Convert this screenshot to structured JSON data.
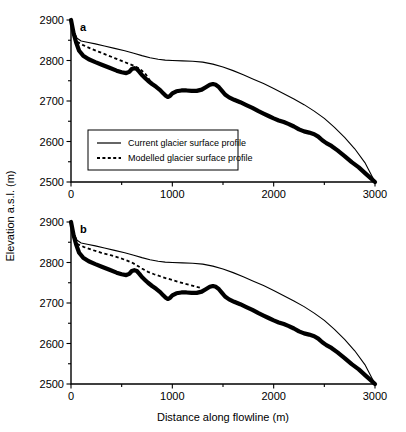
{
  "figure": {
    "xlabel": "Distance along flowline (m)",
    "ylabel": "Elevation a.s.l. (m)",
    "legend": {
      "current_label": "Current glacier surface profile",
      "modelled_label": "Modelled glacier surface profile"
    },
    "panel_a_label": "a",
    "panel_b_label": "b"
  },
  "chart_data": {
    "type": "line",
    "title": "",
    "xlabel": "Distance along flowline (m)",
    "ylabel": "Elevation a.s.l. (m)",
    "xlim": [
      0,
      3000
    ],
    "ylim": [
      2500,
      2900
    ],
    "xticks": [
      0,
      500,
      1000,
      1500,
      2000,
      2500,
      3000
    ],
    "xticklabels": [
      "0",
      "",
      "1000",
      "",
      "2000",
      "",
      "3000"
    ],
    "yticks": [
      2500,
      2550,
      2600,
      2650,
      2700,
      2750,
      2800,
      2850,
      2900
    ],
    "yticklabels": [
      "2500",
      "",
      "2600",
      "",
      "2700",
      "",
      "2800",
      "",
      "2900"
    ],
    "grid": false,
    "legend_position": "lower left",
    "panels": [
      {
        "label": "a",
        "series": [
          {
            "name": "Current glacier surface profile",
            "style": "solid-thin",
            "x": [
              0,
              30,
              60,
              100,
              160,
              240,
              330,
              430,
              530,
              620,
              700,
              780,
              860,
              930,
              1000,
              1100,
              1200,
              1300,
              1400,
              1500,
              1600,
              1700,
              1800,
              1900,
              2000,
              2100,
              2200,
              2300,
              2400,
              2500,
              2600,
              2700,
              2800,
              2900,
              3000
            ],
            "y": [
              2900,
              2872,
              2855,
              2848,
              2845,
              2841,
              2836,
              2830,
              2824,
              2818,
              2812,
              2807,
              2803,
              2801,
              2800,
              2799,
              2798,
              2796,
              2791,
              2784,
              2775,
              2765,
              2754,
              2743,
              2731,
              2718,
              2705,
              2691,
              2675,
              2657,
              2635,
              2610,
              2582,
              2548,
              2500
            ]
          },
          {
            "name": "Modelled glacier surface profile",
            "style": "dashed",
            "x": [
              60,
              120,
              190,
              270,
              350,
              430,
              500,
              560,
              610,
              660,
              700,
              740,
              775,
              800
            ],
            "y": [
              2846,
              2838,
              2830,
              2822,
              2814,
              2806,
              2799,
              2793,
              2788,
              2782,
              2775,
              2765,
              2752,
              2742
            ]
          },
          {
            "name": "Glacier bed / reconstructed profile",
            "style": "solid-thick",
            "x": [
              0,
              25,
              50,
              80,
              120,
              175,
              240,
              310,
              380,
              450,
              500,
              545,
              575,
              600,
              625,
              650,
              675,
              700,
              730,
              760,
              800,
              840,
              880,
              910,
              935,
              955,
              975,
              1000,
              1040,
              1090,
              1140,
              1190,
              1240,
              1290,
              1330,
              1370,
              1400,
              1430,
              1460,
              1490,
              1520,
              1560,
              1610,
              1670,
              1730,
              1790,
              1850,
              1900,
              1950,
              2000,
              2050,
              2100,
              2150,
              2200,
              2250,
              2300,
              2350,
              2400,
              2440,
              2480,
              2520,
              2570,
              2630,
              2700,
              2770,
              2840,
              2910,
              2960,
              3000
            ],
            "y": [
              2900,
              2868,
              2845,
              2824,
              2812,
              2803,
              2796,
              2789,
              2782,
              2775,
              2771,
              2769,
              2772,
              2779,
              2781,
              2779,
              2772,
              2764,
              2757,
              2750,
              2742,
              2735,
              2727,
              2719,
              2713,
              2710,
              2712,
              2719,
              2724,
              2726,
              2726,
              2725,
              2725,
              2728,
              2734,
              2740,
              2742,
              2740,
              2734,
              2725,
              2716,
              2709,
              2703,
              2697,
              2690,
              2683,
              2675,
              2669,
              2663,
              2657,
              2652,
              2648,
              2643,
              2637,
              2630,
              2625,
              2622,
              2618,
              2612,
              2603,
              2596,
              2589,
              2578,
              2564,
              2549,
              2536,
              2520,
              2509,
              2500
            ]
          }
        ]
      },
      {
        "label": "b",
        "series": [
          {
            "name": "Current glacier surface profile",
            "style": "solid-thin",
            "x": [
              0,
              30,
              60,
              100,
              160,
              240,
              330,
              430,
              530,
              620,
              700,
              780,
              860,
              930,
              1000,
              1100,
              1200,
              1300,
              1400,
              1500,
              1600,
              1700,
              1800,
              1900,
              2000,
              2100,
              2200,
              2300,
              2400,
              2500,
              2600,
              2700,
              2800,
              2900,
              3000
            ],
            "y": [
              2900,
              2872,
              2855,
              2848,
              2845,
              2841,
              2836,
              2830,
              2824,
              2818,
              2812,
              2807,
              2803,
              2801,
              2800,
              2799,
              2798,
              2796,
              2791,
              2784,
              2775,
              2765,
              2754,
              2743,
              2731,
              2718,
              2705,
              2691,
              2675,
              2657,
              2635,
              2610,
              2582,
              2548,
              2500
            ]
          },
          {
            "name": "Modelled glacier surface profile",
            "style": "dashed",
            "x": [
              60,
              130,
              210,
              300,
              390,
              470,
              540,
              600,
              650,
              700,
              760,
              820,
              880,
              940,
              1000,
              1060,
              1120,
              1180,
              1240,
              1290
            ],
            "y": [
              2846,
              2838,
              2831,
              2824,
              2818,
              2812,
              2806,
              2800,
              2793,
              2785,
              2777,
              2771,
              2766,
              2761,
              2757,
              2752,
              2748,
              2744,
              2740,
              2737
            ]
          },
          {
            "name": "Glacier bed / reconstructed profile",
            "style": "solid-thick",
            "x": [
              0,
              25,
              50,
              80,
              120,
              175,
              240,
              310,
              380,
              450,
              500,
              545,
              575,
              600,
              625,
              650,
              675,
              700,
              730,
              760,
              800,
              840,
              880,
              910,
              935,
              955,
              975,
              1000,
              1040,
              1090,
              1140,
              1190,
              1240,
              1290,
              1330,
              1370,
              1400,
              1430,
              1460,
              1490,
              1520,
              1560,
              1610,
              1670,
              1730,
              1790,
              1850,
              1900,
              1950,
              2000,
              2050,
              2100,
              2150,
              2200,
              2250,
              2300,
              2350,
              2400,
              2440,
              2480,
              2520,
              2570,
              2630,
              2700,
              2770,
              2840,
              2910,
              2960,
              3000
            ],
            "y": [
              2900,
              2868,
              2845,
              2824,
              2812,
              2803,
              2796,
              2789,
              2782,
              2775,
              2771,
              2769,
              2772,
              2779,
              2781,
              2779,
              2772,
              2764,
              2757,
              2750,
              2742,
              2735,
              2727,
              2719,
              2713,
              2710,
              2712,
              2719,
              2724,
              2726,
              2726,
              2725,
              2725,
              2728,
              2734,
              2740,
              2742,
              2740,
              2734,
              2725,
              2716,
              2709,
              2703,
              2697,
              2690,
              2683,
              2675,
              2669,
              2663,
              2657,
              2652,
              2648,
              2643,
              2637,
              2630,
              2625,
              2622,
              2618,
              2612,
              2603,
              2596,
              2589,
              2578,
              2564,
              2549,
              2536,
              2520,
              2509,
              2500
            ]
          }
        ]
      }
    ]
  }
}
